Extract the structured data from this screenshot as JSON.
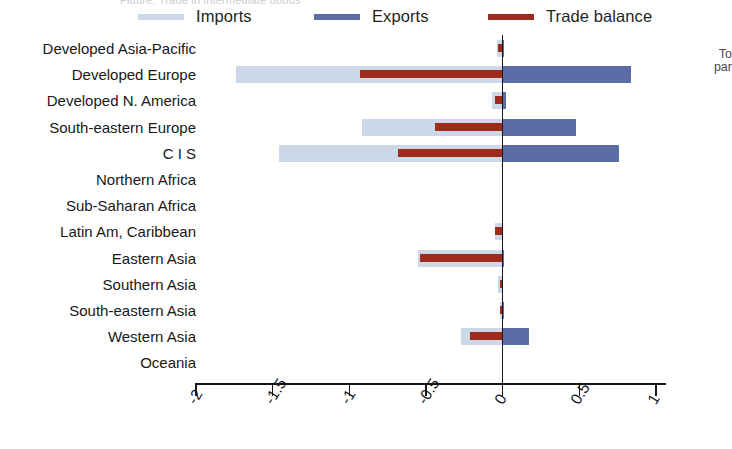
{
  "clipped_title": "Figure: Trade in intermediate goods",
  "right_note": {
    "line1": "To",
    "line2": "par"
  },
  "legend": {
    "position": "top",
    "items": [
      {
        "label": "Imports",
        "color": "#ccd7e7",
        "name": "legend-imports"
      },
      {
        "label": "Exports",
        "color": "#5c6ca4",
        "name": "legend-exports"
      },
      {
        "label": "Trade balance",
        "color": "#9e2c1d",
        "name": "legend-balance"
      }
    ]
  },
  "axis": {
    "ticks": [
      "-2",
      "-1.5",
      "-1",
      "-0.5",
      "0",
      "0.5",
      "1"
    ],
    "tick_values": [
      -2,
      -1.5,
      -1,
      -0.5,
      0,
      0.5,
      1
    ],
    "xmin": -2,
    "xmax": 1,
    "zero_label": "0"
  },
  "chart_data": {
    "type": "bar",
    "orientation": "horizontal",
    "title": "",
    "xlabel": "",
    "ylabel": "",
    "xlim": [
      -2,
      1
    ],
    "grid": false,
    "legend_position": "top",
    "categories": [
      "Developed Asia-Pacific",
      "Developed Europe",
      "Developed N. America",
      "South-eastern Europe",
      "C I S",
      "Northern Africa",
      "Sub-Saharan Africa",
      "Latin Am, Caribbean",
      "Eastern Asia",
      "Southern Asia",
      "South-eastern Asia",
      "Western Asia",
      "Oceania"
    ],
    "series": [
      {
        "name": "Imports",
        "color": "#ccd7e7",
        "values": [
          -0.04,
          -1.74,
          -0.07,
          -0.92,
          -1.46,
          0.0,
          0.0,
          -0.05,
          -0.55,
          -0.03,
          -0.02,
          -0.27,
          0.0
        ]
      },
      {
        "name": "Exports",
        "color": "#5c6ca4",
        "values": [
          0.01,
          0.84,
          0.02,
          0.48,
          0.76,
          0.0,
          0.0,
          0.0,
          0.01,
          0.0,
          0.01,
          0.17,
          0.0
        ]
      },
      {
        "name": "Trade balance",
        "color": "#9e2c1d",
        "values": [
          -0.03,
          -0.93,
          -0.05,
          -0.44,
          -0.68,
          0.0,
          0.0,
          -0.05,
          -0.54,
          -0.02,
          -0.02,
          -0.21,
          0.0
        ]
      }
    ]
  }
}
